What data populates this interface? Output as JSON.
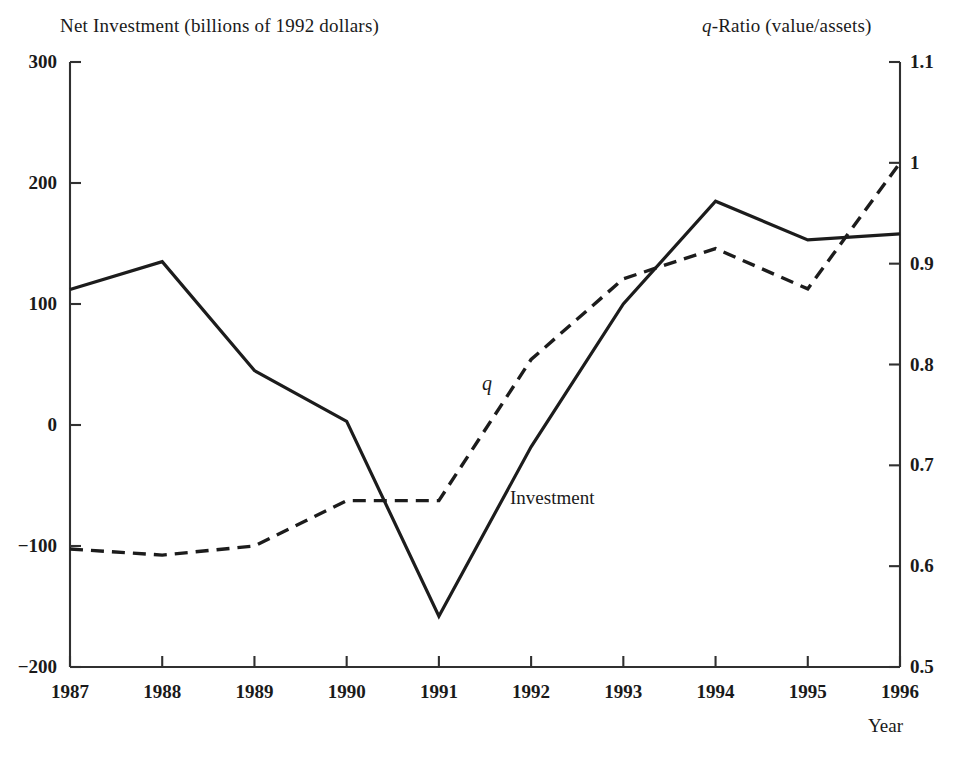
{
  "chart_data": {
    "type": "line",
    "title": "",
    "xlabel": "Year",
    "ylabel": "Net Investment (billions of 1992 dollars)",
    "y2label": "q-Ratio (value/assets)",
    "categories": [
      "1987",
      "1988",
      "1989",
      "1990",
      "1991",
      "1992",
      "1993",
      "1994",
      "1995",
      "1996"
    ],
    "x": [
      1987,
      1988,
      1989,
      1990,
      1991,
      1992,
      1993,
      1994,
      1995,
      1996
    ],
    "xlim": [
      1987,
      1996
    ],
    "ylim": [
      -200,
      300
    ],
    "y2lim": [
      0.5,
      1.1
    ],
    "grid": false,
    "legend_position": "inline-annotations",
    "series": [
      {
        "name": "Investment",
        "axis": "left",
        "style": "solid",
        "color": "#1c1c1c",
        "values": [
          112,
          135,
          45,
          3,
          -158,
          -18,
          100,
          185,
          153,
          158
        ]
      },
      {
        "name": "q",
        "axis": "right",
        "style": "dashed",
        "color": "#1c1c1c",
        "values": [
          0.617,
          0.611,
          0.62,
          0.665,
          0.665,
          0.805,
          0.885,
          0.915,
          0.875,
          1.0
        ]
      }
    ],
    "yticks": [
      300,
      200,
      100,
      0,
      -100,
      -200
    ],
    "ytick_labels": [
      "300",
      "200",
      "100",
      "0",
      "−100",
      "−200"
    ],
    "y2ticks": [
      1.1,
      1.0,
      0.9,
      0.8,
      0.7,
      0.6,
      0.5
    ],
    "y2tick_labels": [
      "1.1",
      "1",
      "0.9",
      "0.8",
      "0.7",
      "0.6",
      "0.5"
    ],
    "annotations": [
      {
        "text": "q",
        "italic": true,
        "series": "q"
      },
      {
        "text": "Investment",
        "italic": false,
        "series": "Investment"
      }
    ]
  },
  "axes": {
    "left_title_text": "Net Investment (billions of 1992 dollars)",
    "right_title_prefix": "q",
    "right_title_suffix": "-Ratio (value/assets)",
    "x_title": "Year"
  },
  "labels": {
    "q": "q",
    "investment": "Investment"
  }
}
